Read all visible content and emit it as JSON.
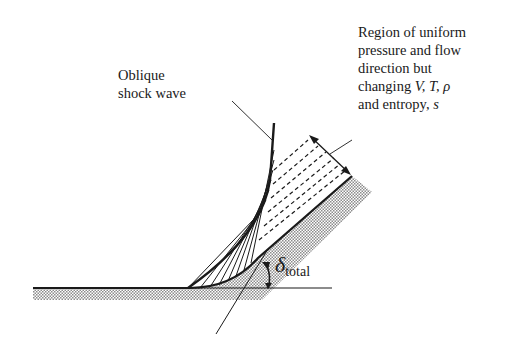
{
  "figure": {
    "labels": {
      "shock": [
        "Oblique",
        "shock wave"
      ],
      "region": [
        "Region of uniform",
        "pressure and flow",
        "direction but",
        "changing "
      ],
      "region_vars": "V, T, ρ",
      "region_last": "and entropy, ",
      "region_s": "s",
      "angle_symbol": "δ",
      "angle_subscript": "total"
    },
    "colors": {
      "ink": "#1a1a1a",
      "hatch": "#9a9a9a",
      "background": "#ffffff"
    }
  }
}
